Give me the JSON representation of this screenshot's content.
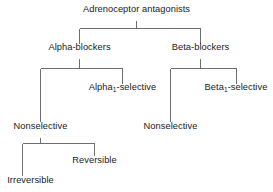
{
  "diagram": {
    "type": "hierarchy-tree",
    "line_color": "#6e6e6e",
    "text_color": "#1a1a1a",
    "background": "#ffffff",
    "nodes": [
      {
        "id": "root",
        "label": "Adrenoceptor antagonists",
        "level": 0,
        "x": 136,
        "y": 10,
        "align": "center"
      },
      {
        "id": "alpha-blockers",
        "label": "Alpha-blockers",
        "level": 1,
        "x": 79,
        "y": 48,
        "align": "center"
      },
      {
        "id": "beta-blockers",
        "label": "Beta-blockers",
        "level": 1,
        "x": 200,
        "y": 48,
        "align": "center"
      },
      {
        "id": "alpha1-selective",
        "label_pre": "Alpha",
        "label_sub": "1",
        "label_post": "-selective",
        "level": 2,
        "x": 122,
        "y": 88,
        "align": "center"
      },
      {
        "id": "alpha-nonselective",
        "label": "Nonselective",
        "level": 2,
        "x": 40,
        "y": 127,
        "align": "center"
      },
      {
        "id": "beta1-selective",
        "label_pre": "Beta",
        "label_sub": "1",
        "label_post": "-selective",
        "level": 2,
        "x": 236,
        "y": 88,
        "align": "center"
      },
      {
        "id": "beta-nonselective",
        "label": "Nonselective",
        "level": 2,
        "x": 170,
        "y": 127,
        "align": "center"
      },
      {
        "id": "reversible",
        "label": "Reversible",
        "level": 3,
        "x": 94,
        "y": 161,
        "align": "center"
      },
      {
        "id": "irreversible",
        "label": "Irreversible",
        "level": 3,
        "x": 30,
        "y": 181,
        "align": "center"
      }
    ],
    "edges": [
      {
        "id": "edge-root-to-split",
        "from": "root",
        "to": "level1-bus"
      },
      {
        "id": "edge-root-alpha",
        "from": "root",
        "to": "alpha-blockers"
      },
      {
        "id": "edge-root-beta",
        "from": "root",
        "to": "beta-blockers"
      },
      {
        "id": "edge-alpha-nonselective",
        "from": "alpha-blockers",
        "to": "alpha-nonselective"
      },
      {
        "id": "edge-alpha-alpha1",
        "from": "alpha-blockers",
        "to": "alpha1-selective"
      },
      {
        "id": "edge-beta-nonselective",
        "from": "beta-blockers",
        "to": "beta-nonselective"
      },
      {
        "id": "edge-beta-beta1",
        "from": "beta-blockers",
        "to": "beta1-selective"
      },
      {
        "id": "edge-nonselective-irreversible",
        "from": "alpha-nonselective",
        "to": "irreversible"
      },
      {
        "id": "edge-nonselective-reversible",
        "from": "alpha-nonselective",
        "to": "reversible"
      }
    ]
  }
}
